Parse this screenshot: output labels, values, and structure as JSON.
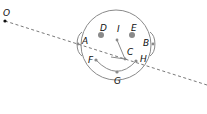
{
  "diagram": {
    "title": "",
    "colors": {
      "stroke": "#8a8a8a",
      "dashed_line": "#6a6a6a",
      "point": "#8a8a8a",
      "origin_point": "#111111",
      "label": "#111111"
    },
    "points": [
      {
        "id": "O",
        "label": "O",
        "x": 5,
        "y": 21,
        "label_x": 3,
        "label_y": 16
      },
      {
        "id": "A",
        "label": "A",
        "x": 78,
        "y": 44,
        "label_x": 82,
        "label_y": 44
      },
      {
        "id": "B",
        "label": "B",
        "x": 153,
        "y": 44,
        "label_x": 143,
        "label_y": 46
      },
      {
        "id": "C",
        "label": "C",
        "x": 125,
        "y": 59,
        "label_x": 127,
        "label_y": 55
      },
      {
        "id": "D",
        "label": "D",
        "x": 101,
        "y": 35,
        "label_x": 100,
        "label_y": 31
      },
      {
        "id": "E",
        "label": "E",
        "x": 132,
        "y": 35,
        "label_x": 131,
        "label_y": 31
      },
      {
        "id": "F",
        "label": "F",
        "x": 96,
        "y": 60,
        "label_x": 88,
        "label_y": 63
      },
      {
        "id": "G",
        "label": "G",
        "x": 117,
        "y": 72,
        "label_x": 114,
        "label_y": 84
      },
      {
        "id": "H",
        "label": "H",
        "x": 136,
        "y": 61,
        "label_x": 140,
        "label_y": 62
      },
      {
        "id": "I",
        "label": "I",
        "x": 117,
        "y": 40,
        "label_x": 117,
        "label_y": 32
      }
    ],
    "shapes": {
      "head_circle": {
        "cx": 116,
        "cy": 45,
        "r": 35
      },
      "dashed_line": {
        "x1": 5,
        "y1": 21,
        "x2": 207,
        "y2": 85
      },
      "mouth_arc": "F-G-H",
      "nose_segment": "I-C"
    }
  }
}
